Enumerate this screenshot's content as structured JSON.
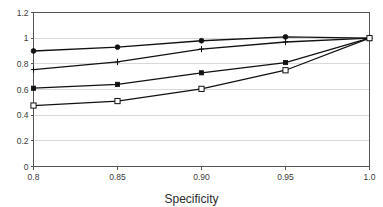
{
  "chart_data": {
    "type": "line",
    "title": "",
    "xlabel": "Specificity",
    "ylabel": "",
    "x": [
      0.8,
      0.85,
      0.9,
      0.95,
      1.0
    ],
    "xtick_labels": [
      "0.8",
      "0.85",
      "0.90",
      "0.95",
      "1.0"
    ],
    "ytick_labels": [
      "0",
      "0.2",
      "0.4",
      "0.6",
      "0.8",
      "1",
      "1.2"
    ],
    "ytick_values": [
      0,
      0.2,
      0.4,
      0.6,
      0.8,
      1,
      1.2
    ],
    "xlim": [
      0.8,
      1.0
    ],
    "ylim": [
      0,
      1.2
    ],
    "grid": true,
    "grid_axis": "y",
    "legend": "none",
    "line_color": "#111111",
    "grid_color": "#d9d9d9",
    "axis_color": "#555555",
    "background": "#ffffff",
    "series": [
      {
        "name": "series-1",
        "marker": "filled-circle",
        "values": [
          0.9,
          0.93,
          0.98,
          1.01,
          1.0
        ]
      },
      {
        "name": "series-2",
        "marker": "cross",
        "values": [
          0.755,
          0.815,
          0.915,
          0.97,
          1.0
        ]
      },
      {
        "name": "series-3",
        "marker": "filled-square",
        "values": [
          0.61,
          0.64,
          0.73,
          0.81,
          1.0
        ]
      },
      {
        "name": "series-4",
        "marker": "open-square",
        "values": [
          0.475,
          0.51,
          0.605,
          0.75,
          1.0
        ]
      }
    ]
  }
}
